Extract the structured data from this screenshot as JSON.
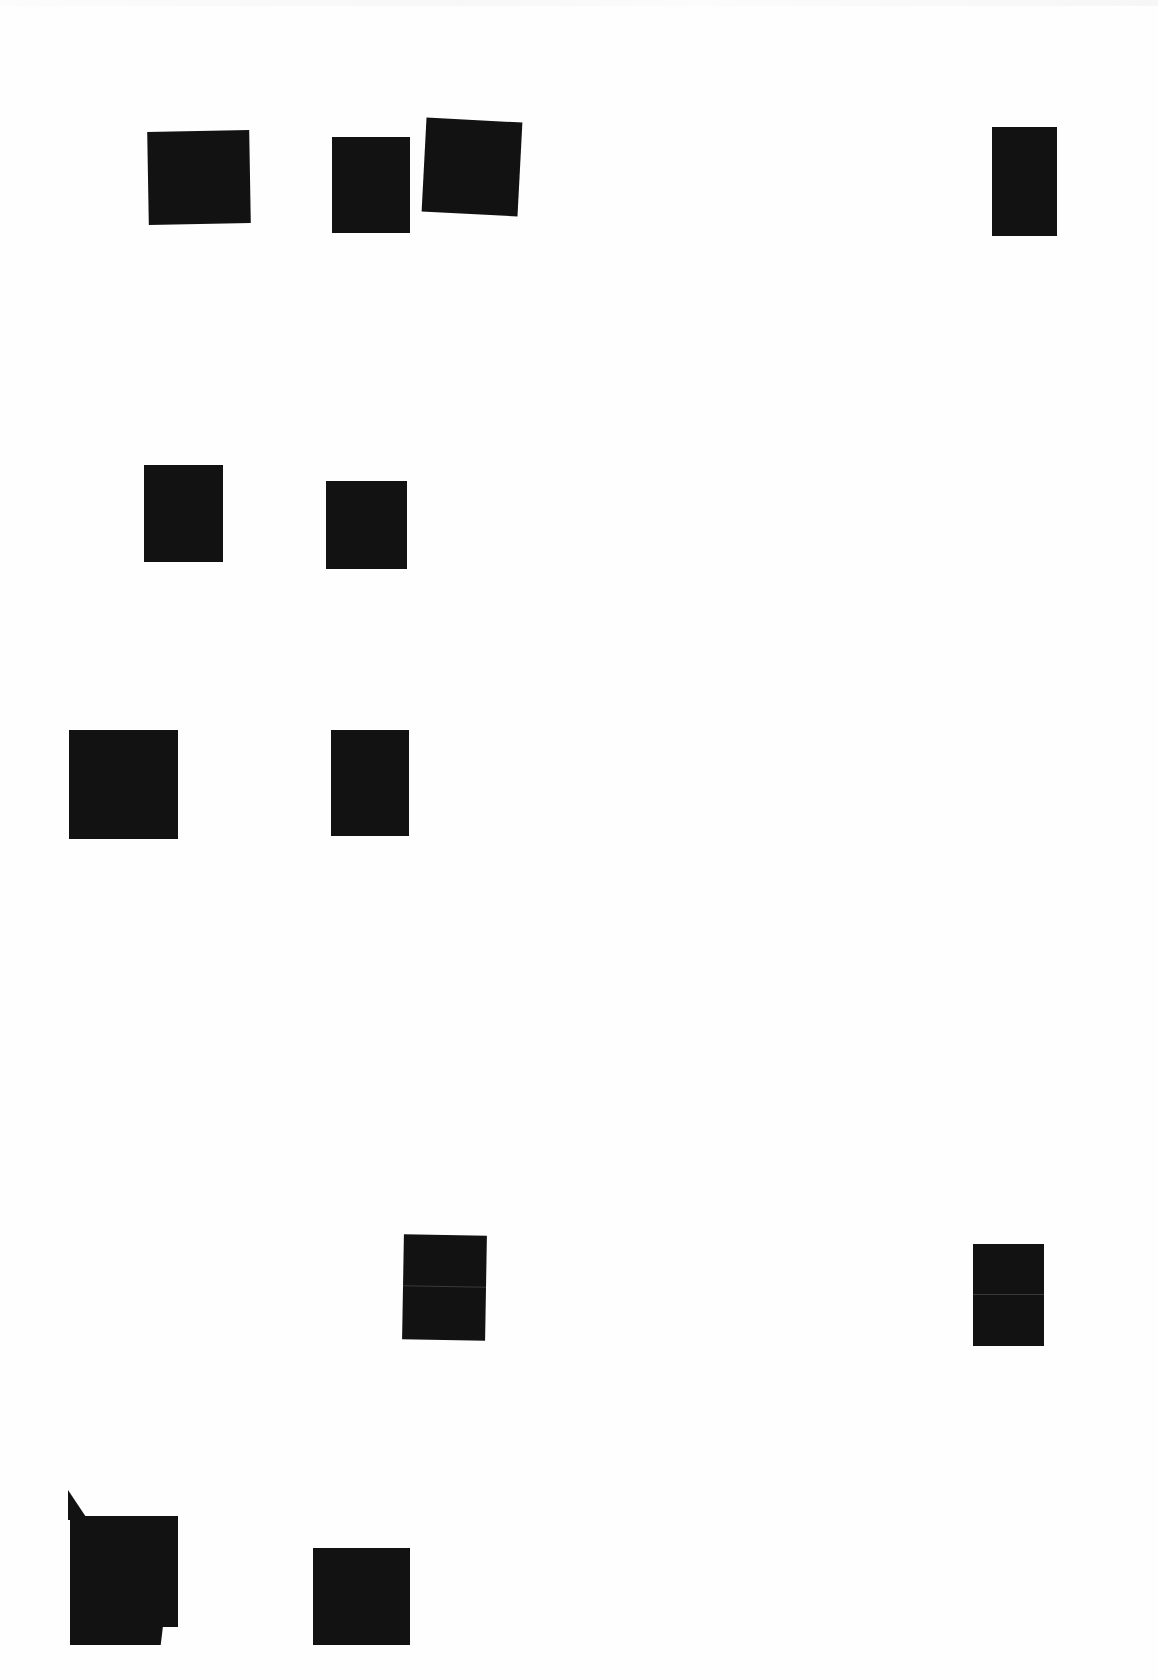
{
  "document": {
    "type": "scanned page with redactions",
    "background_color": "#fefefe",
    "redaction_color": "#121212",
    "redactions": [
      {
        "id": "r1",
        "x": 148,
        "y": 131,
        "w": 102,
        "h": 93,
        "rotate": -1
      },
      {
        "id": "r2",
        "x": 332,
        "y": 137,
        "w": 78,
        "h": 96,
        "rotate": 0
      },
      {
        "id": "r3",
        "x": 424,
        "y": 120,
        "w": 96,
        "h": 94,
        "rotate": 3
      },
      {
        "id": "r4",
        "x": 992,
        "y": 127,
        "w": 65,
        "h": 109,
        "rotate": 0
      },
      {
        "id": "r5",
        "x": 144,
        "y": 465,
        "w": 79,
        "h": 97,
        "rotate": 0
      },
      {
        "id": "r6",
        "x": 326,
        "y": 481,
        "w": 81,
        "h": 88,
        "rotate": 0
      },
      {
        "id": "r7",
        "x": 69,
        "y": 730,
        "w": 109,
        "h": 109,
        "rotate": 0
      },
      {
        "id": "r8",
        "x": 331,
        "y": 730,
        "w": 78,
        "h": 106,
        "rotate": 0
      },
      {
        "id": "r9",
        "x": 403,
        "y": 1235,
        "w": 83,
        "h": 105,
        "rotate": 1,
        "seam": true
      },
      {
        "id": "r10",
        "x": 973,
        "y": 1244,
        "w": 71,
        "h": 102,
        "rotate": 0,
        "seam": true
      },
      {
        "id": "r11",
        "x": 70,
        "y": 1516,
        "w": 108,
        "h": 129,
        "rotate": 0
      },
      {
        "id": "r12",
        "x": 313,
        "y": 1548,
        "w": 97,
        "h": 97,
        "rotate": 0
      }
    ]
  }
}
